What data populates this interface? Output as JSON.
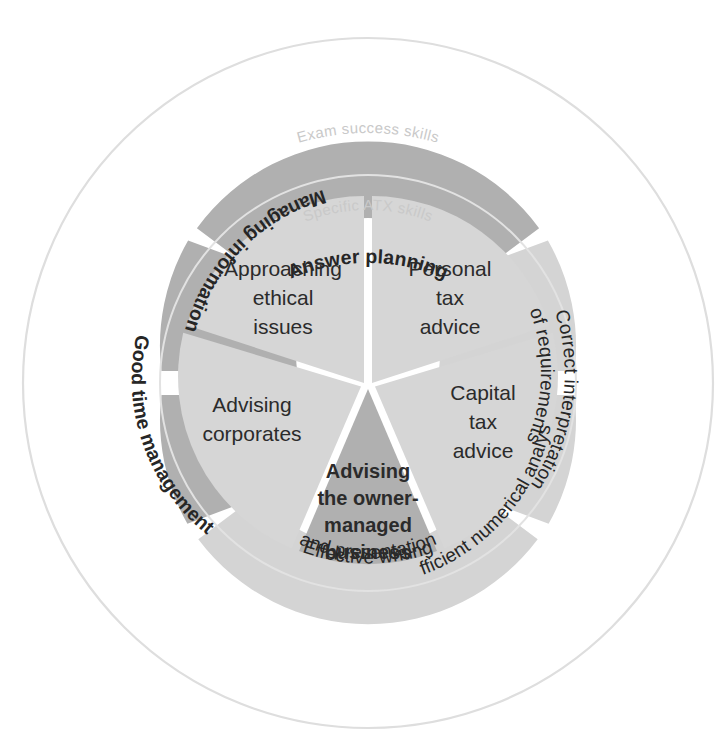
{
  "diagram": {
    "outer_ring_label": "Exam success skills",
    "inner_ring_label": "Specific ATX skills",
    "colors": {
      "background": "#ffffff",
      "outer_segment_dark": "#b0b0b0",
      "outer_segment_light": "#d4d4d4",
      "inner_segment_light": "#d6d6d6",
      "inner_segment_dark": "#b0b0b0",
      "ring_line": "#dcdcdc",
      "ring_label_text": "#c9c9c9",
      "segment_text": "#262626",
      "divider": "#ffffff"
    },
    "outer_segments": [
      {
        "id": "answer-planning",
        "label": "Answer planning",
        "lines": [
          "Answer planning"
        ],
        "tone": "dark"
      },
      {
        "id": "correct-interpretation",
        "label": "Correct interpretation of requirements",
        "lines": [
          "Correct interpretation",
          "of requirements"
        ],
        "tone": "light"
      },
      {
        "id": "efficient-numerical-analysis",
        "label": "Efficient numerical analysis",
        "lines": [
          "Efficient numerical analysis"
        ],
        "tone": "light"
      },
      {
        "id": "effective-writing",
        "label": "Effective writing and presentation",
        "lines": [
          "Effective writing",
          "and presentation"
        ],
        "tone": "light"
      },
      {
        "id": "good-time-management",
        "label": "Good time management",
        "lines": [
          "Good time management"
        ],
        "tone": "dark"
      },
      {
        "id": "managing-information",
        "label": "Managing information",
        "lines": [
          "Managing information"
        ],
        "tone": "dark"
      }
    ],
    "inner_segments": [
      {
        "id": "personal-tax-advice",
        "label": "Personal tax advice",
        "lines": [
          "Personal",
          "tax",
          "advice"
        ],
        "tone": "light"
      },
      {
        "id": "capital-tax-advice",
        "label": "Capital tax advice",
        "lines": [
          "Capital",
          "tax",
          "advice"
        ],
        "tone": "light"
      },
      {
        "id": "advising-owner-managed-business",
        "label": "Advising the owner-managed business",
        "lines": [
          "Advising",
          "the owner-",
          "managed",
          "business"
        ],
        "tone": "dark"
      },
      {
        "id": "advising-corporates",
        "label": "Advising corporates",
        "lines": [
          "Advising",
          "corporates"
        ],
        "tone": "light"
      },
      {
        "id": "approaching-ethical-issues",
        "label": "Approaching ethical issues",
        "lines": [
          "Approaching",
          "ethical",
          "issues"
        ],
        "tone": "light"
      }
    ]
  }
}
